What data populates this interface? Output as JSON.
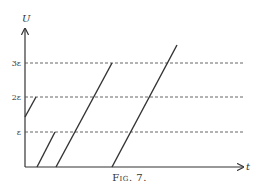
{
  "figure": {
    "caption": "Fig. 7.",
    "y_axis_label": "U",
    "x_axis_label": "t",
    "levels": [
      {
        "label": "ε",
        "y": 132
      },
      {
        "label": "2ε",
        "y": 97
      },
      {
        "label": "3ε",
        "y": 63
      }
    ],
    "segments": [
      {
        "x1": 25,
        "y1": 117,
        "x2": 36,
        "y2": 97
      },
      {
        "x1": 37,
        "y1": 167,
        "x2": 55,
        "y2": 132
      },
      {
        "x1": 56,
        "y1": 167,
        "x2": 112,
        "y2": 63
      },
      {
        "x1": 112,
        "y1": 167,
        "x2": 177,
        "y2": 45
      }
    ],
    "colors": {
      "line": "#333333",
      "dash": "#555555"
    }
  }
}
